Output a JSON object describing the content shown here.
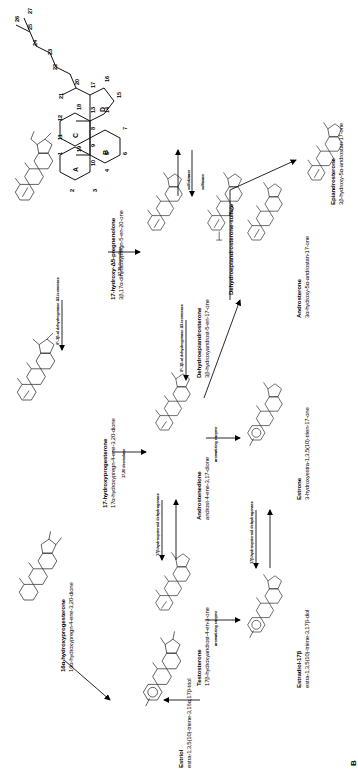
{
  "figure": {
    "panel_label": "B",
    "title_present": false
  },
  "reference_structure": {
    "name": "steroid-numbering-skeleton",
    "ring_letters": [
      "A",
      "B",
      "C",
      "D"
    ],
    "carbon_numbers": [
      "1",
      "2",
      "3",
      "4",
      "5",
      "6",
      "7",
      "8",
      "9",
      "10",
      "11",
      "12",
      "13",
      "14",
      "15",
      "16",
      "17",
      "18",
      "19",
      "20",
      "21",
      "22",
      "23",
      "24",
      "25",
      "26",
      "27"
    ]
  },
  "compounds": [
    {
      "id": "17-hydroxy-d5-pregnenolone",
      "name": "17-hydroxy-Δ5-pregnenolone",
      "iupac": "3β,17α-dihydroxypregn-5-en-20-one"
    },
    {
      "id": "dehydroepiandrosterone-sulfate",
      "name": "Dehydroepiandrosterone-sulfate",
      "iupac": ""
    },
    {
      "id": "17-hydroxyprogesterone",
      "name": "17-hydroxyprogesterone",
      "iupac": "17α-hydroxypregn-4-ene-3,20-dione"
    },
    {
      "id": "dehydroepiandrosterone",
      "name": "Dehydroepiandrosterone",
      "iupac": "3β-hydroxyandrost-5-en-17-one"
    },
    {
      "id": "epiandrosterone",
      "name": "Epiandrosterone",
      "iupac": "3β-hydroxy-5α-androstan-17-one"
    },
    {
      "id": "16a-hydroxyprogesterone",
      "name": "16α-hydroxyprogesterone",
      "iupac": "16α-hydroxypregn-4-ene-3,20-dione"
    },
    {
      "id": "androstenedione",
      "name": "Androstenedione",
      "iupac": "androst-4-ene-3,17-dione"
    },
    {
      "id": "androsterone",
      "name": "Androsterone",
      "iupac": "3α-hydroxy-5α-androstan-17-one"
    },
    {
      "id": "estrone",
      "name": "Estrone",
      "iupac": "3-hydroxyestra-1,3,5(10)-trien-17-one"
    },
    {
      "id": "testosterone",
      "name": "Testosterone",
      "iupac": "17β-hydroxyandrost-4-en-3-one"
    },
    {
      "id": "estradiol-17b",
      "name": "Estradiol-17β",
      "iupac": "estra-1,3,5(10)-triene-3,17β-diol"
    },
    {
      "id": "estriol",
      "name": "Estriol",
      "iupac": "estra-1,3,5(10)-triene-3,16α,17β-triol"
    }
  ],
  "enzymes": [
    {
      "id": "desmolase-top",
      "label": "17,20 desmolase"
    },
    {
      "id": "desmolase-mid",
      "label": "17,20 desmolase"
    },
    {
      "id": "sulfatase",
      "label": "sulfatase"
    },
    {
      "id": "sulfokinase",
      "label": "sulfokinase"
    },
    {
      "id": "3b-ol-dehydrogenase-1",
      "label": "δ⁵-3β-ol dehydrogenase Δ3-isomerase"
    },
    {
      "id": "3b-ol-dehydrogenase-2",
      "label": "δ⁵-3β-ol dehydrogenase Δ3-isomerase"
    },
    {
      "id": "aromatizing-enzyme-1",
      "label": "aromatizing enzyme"
    },
    {
      "id": "aromatizing-enzyme-2",
      "label": "aromatizing enzyme"
    },
    {
      "id": "17b-hydroxysteroid-dehydrogenase-1",
      "label": "17β-hydroxysteroid dehydrogenase"
    },
    {
      "id": "17b-hydroxysteroid-dehydrogenase-2",
      "label": "17β-hydroxysteroid dehydrogenase"
    }
  ],
  "atom_labels": {
    "ch3": "CH₃",
    "oh": "OH",
    "ho": "HO",
    "o": "O",
    "so3h": "HO–S–O",
    "c_eq_o": "O"
  }
}
